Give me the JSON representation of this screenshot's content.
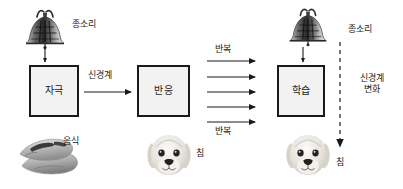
{
  "diagram": {
    "nodes": [
      {
        "id": "stimulus",
        "label": "자극"
      },
      {
        "id": "response",
        "label": "반응"
      },
      {
        "id": "learning",
        "label": "학습"
      }
    ],
    "edge_labels": {
      "nervous_system": "신경계",
      "repetition_top": "반복",
      "repetition_bottom": "반복",
      "nervous_system_change": "신경계 변화",
      "nervous_system_change_line1": "신경계",
      "nervous_system_change_line2": "변화"
    },
    "picture_labels": {
      "bell_left": "종소리",
      "bell_right": "종소리",
      "food": "음식",
      "saliva_left": "침",
      "saliva_right": "침"
    },
    "icons": {
      "bell_left": "bell-icon",
      "bell_right": "bell-icon",
      "food": "sausage-food-icon",
      "dog_left": "puppy-icon",
      "dog_right": "puppy-icon",
      "arrow_down_bell_left": "arrow-down-icon",
      "arrow_down_bell_right": "arrow-down-icon",
      "arrow_right_nervous": "arrow-right-icon",
      "repetition_arrows": "arrow-right-icon",
      "dashed_arrow_down": "dashed-arrow-down-icon"
    },
    "counts": {
      "repetition_arrows": 5
    },
    "colors": {
      "stroke": "#1a1a1a",
      "box_fill": "#f2f2f2",
      "text": "#1a1a1a",
      "background": "#ffffff",
      "art_dark": "#3a3a3a",
      "art_mid": "#8c8c8c",
      "art_light": "#d8d8d8"
    }
  }
}
